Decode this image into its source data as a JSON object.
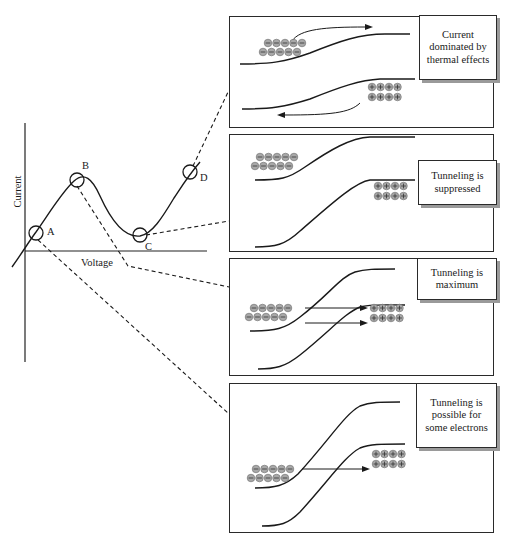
{
  "graph": {
    "x_axis_label": "Voltage",
    "y_axis_label": "Current",
    "points": [
      {
        "id": "A",
        "label": "A"
      },
      {
        "id": "B",
        "label": "B"
      },
      {
        "id": "C",
        "label": "C"
      },
      {
        "id": "D",
        "label": "D"
      }
    ]
  },
  "panels": [
    {
      "id": "D",
      "caption": "Current dominated by thermal effects",
      "caption_lines": [
        "Current",
        "dominated by",
        "thermal",
        "effects"
      ],
      "electrons": 10,
      "holes": 8
    },
    {
      "id": "C",
      "caption": "Tunneling is suppressed",
      "caption_lines": [
        "Tunneling is",
        "suppressed"
      ],
      "electrons": 10,
      "holes": 8
    },
    {
      "id": "B",
      "caption": "Tunneling is maximum",
      "caption_lines": [
        "Tunneling is",
        "maximum"
      ],
      "electrons": 10,
      "holes": 8
    },
    {
      "id": "A",
      "caption": "Tunneling is possible for some electrons",
      "caption_lines": [
        "Tunneling is",
        "possible for",
        "some",
        "electrons"
      ],
      "electrons": 10,
      "holes": 8
    }
  ],
  "symbols": {
    "electron": "−",
    "hole": "+"
  },
  "colors": {
    "line": "#1a1a1a",
    "particle_fill": "#a8a8a8",
    "particle_stroke": "#6a6a6a",
    "shadow": "#9a9a9a"
  }
}
